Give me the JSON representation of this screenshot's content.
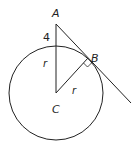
{
  "diagram": {
    "labels": {
      "A": "A",
      "B": "B",
      "C": "C",
      "r_vertical": "r",
      "r_radius": "r",
      "segment_length": "4"
    },
    "stroke_color": "#222222",
    "points": {
      "A": [
        56,
        24
      ],
      "B": [
        88,
        58
      ],
      "C": [
        56,
        93
      ],
      "tangent_end": [
        131,
        103
      ]
    },
    "circle": {
      "center": [
        56,
        93
      ],
      "radius": 47
    }
  }
}
